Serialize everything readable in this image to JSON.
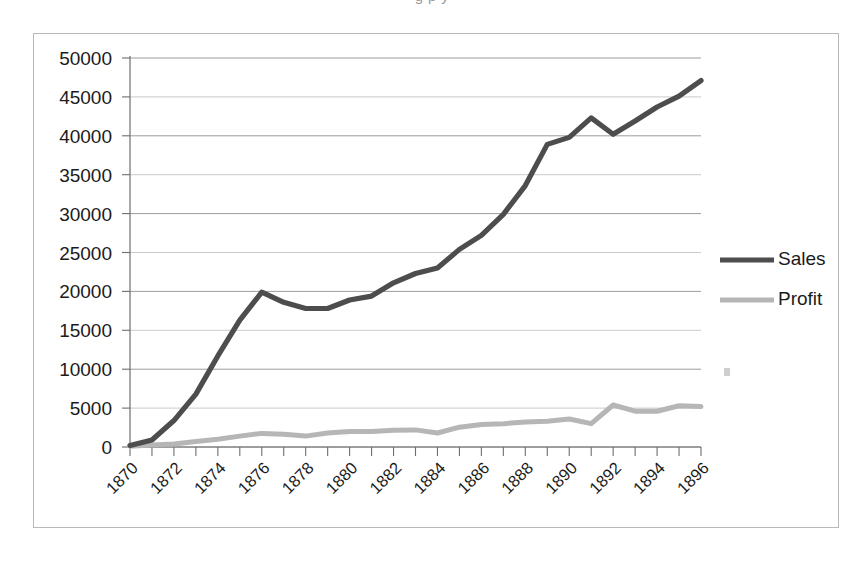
{
  "page": {
    "top_caption_fragment": "g p y"
  },
  "chart_data": {
    "type": "line",
    "title": "",
    "subtitle": "",
    "xlabel": "",
    "ylabel": "",
    "x": [
      1870,
      1871,
      1872,
      1873,
      1874,
      1875,
      1876,
      1877,
      1878,
      1879,
      1880,
      1881,
      1882,
      1883,
      1884,
      1885,
      1886,
      1887,
      1888,
      1889,
      1890,
      1891,
      1892,
      1893,
      1894,
      1895,
      1896
    ],
    "series": [
      {
        "name": "Sales",
        "color": "#4d4d4d",
        "values": [
          200,
          900,
          3400,
          6800,
          11700,
          16300,
          19900,
          18600,
          17800,
          17800,
          18900,
          19400,
          21100,
          22300,
          23000,
          25400,
          27200,
          29900,
          33600,
          38900,
          39800,
          42300,
          40200,
          41900,
          43700,
          45100,
          47100
        ]
      },
      {
        "name": "Profit",
        "color": "#b6b6b6",
        "values": [
          100,
          250,
          400,
          700,
          1000,
          1400,
          1750,
          1650,
          1400,
          1800,
          2000,
          2000,
          2150,
          2200,
          1800,
          2550,
          2900,
          3000,
          3200,
          3300,
          3600,
          3000,
          5400,
          4600,
          4600,
          5300,
          5200
        ]
      }
    ],
    "ylim": [
      0,
      50000
    ],
    "yticks": [
      0,
      5000,
      10000,
      15000,
      20000,
      25000,
      30000,
      35000,
      40000,
      45000,
      50000
    ],
    "ytick_labels": [
      "0",
      "5000",
      "10000",
      "15000",
      "20000",
      "25000",
      "30000",
      "35000",
      "40000",
      "45000",
      "50000"
    ],
    "xlim": [
      1870,
      1896
    ],
    "xticks": [
      1870,
      1871,
      1872,
      1873,
      1874,
      1875,
      1876,
      1877,
      1878,
      1879,
      1880,
      1881,
      1882,
      1883,
      1884,
      1885,
      1886,
      1887,
      1888,
      1889,
      1890,
      1891,
      1892,
      1893,
      1894,
      1895,
      1896
    ],
    "xtick_labels_shown": [
      "1870",
      "1872",
      "1874",
      "1876",
      "1878",
      "1880",
      "1882",
      "1884",
      "1886",
      "1888",
      "1890",
      "1892",
      "1894",
      "1896"
    ],
    "xtick_label_rotation": -45,
    "grid": {
      "horizontal": true,
      "vertical": false,
      "color": "#8c8c8c"
    },
    "legend": {
      "position": "right",
      "entries": [
        {
          "label": "Sales",
          "color": "#4d4d4d"
        },
        {
          "label": "Profit",
          "color": "#b6b6b6"
        }
      ]
    },
    "plot_background": "#ffffff",
    "frame_border_color": "#b9b9b9"
  }
}
